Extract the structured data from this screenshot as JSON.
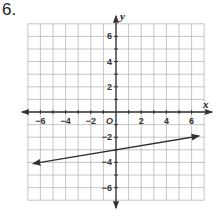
{
  "problem": {
    "number": "6."
  },
  "chart_data": {
    "type": "line",
    "title": "",
    "xlabel": "x",
    "ylabel": "y",
    "origin_label": "O",
    "xlim": [
      -7,
      7
    ],
    "ylim": [
      -7,
      7
    ],
    "grid": true,
    "grid_step": 1,
    "x_tick_labels": [
      "-6",
      "-4",
      "-2",
      "2",
      "4",
      "6"
    ],
    "y_tick_labels": [
      "6",
      "4",
      "2",
      "-2",
      "-4",
      "-6"
    ],
    "series": [
      {
        "name": "line",
        "arrows_both_ends": true,
        "x": [
          -6.6,
          6.6
        ],
        "y": [
          -4.1,
          -1.9
        ],
        "y_intercept": -3,
        "slope": 0.1667
      }
    ]
  },
  "colors": {
    "grid": "#b8b8b8",
    "axis": "#333333",
    "line": "#333333"
  }
}
